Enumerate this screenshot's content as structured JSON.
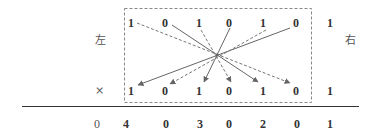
{
  "labels": {
    "left": "左",
    "right": "右",
    "times": "×"
  },
  "top_row": [
    "1",
    "0",
    "1",
    "0",
    "1",
    "0"
  ],
  "top_extra": "1",
  "bottom_row": [
    "1",
    "0",
    "1",
    "0",
    "1",
    "0"
  ],
  "bottom_extra": "1",
  "result_row": [
    "0",
    "4",
    "0",
    "3",
    "0",
    "2",
    "0",
    "1"
  ],
  "colors": {
    "line": "#555555",
    "box": "#888888",
    "text": "#333333"
  }
}
